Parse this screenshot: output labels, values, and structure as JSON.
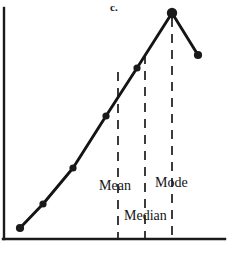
{
  "figure": {
    "panel_label": "c.",
    "background_color": "#ffffff",
    "ink_color": "#1a1a1a"
  },
  "annotations": [
    {
      "id": "mean",
      "label": "Mean",
      "line_x": 118,
      "line_top": 72,
      "line_bottom": 239
    },
    {
      "id": "median",
      "label": "Median",
      "line_x": 145,
      "line_top": 55,
      "line_bottom": 239
    },
    {
      "id": "mode",
      "label": "Mode",
      "line_x": 172,
      "line_top": 18,
      "line_bottom": 239
    }
  ],
  "chart_data": {
    "type": "line",
    "title": "c.",
    "xlabel": "",
    "ylabel": "",
    "grid": false,
    "legend": null,
    "axis": {
      "y_axis_x": 4,
      "y_axis_top": 8,
      "y_axis_bottom": 239,
      "x_axis_y": 239,
      "x_axis_left": 4,
      "x_axis_right": 225
    },
    "xlim": [
      0,
      228
    ],
    "ylim": [
      0,
      257
    ],
    "note": "Negatively (left) skewed frequency polygon: mean < median < mode",
    "series": [
      {
        "name": "frequency",
        "marker": "filled-circle",
        "points": [
          {
            "x": 20,
            "y": 228
          },
          {
            "x": 43,
            "y": 204
          },
          {
            "x": 73,
            "y": 168
          },
          {
            "x": 106,
            "y": 116
          },
          {
            "x": 137,
            "y": 68
          },
          {
            "x": 172,
            "y": 13
          },
          {
            "x": 198,
            "y": 55
          }
        ]
      }
    ],
    "annotated_points": {
      "mean_x": 118,
      "median_x": 145,
      "mode_x": 172
    }
  }
}
